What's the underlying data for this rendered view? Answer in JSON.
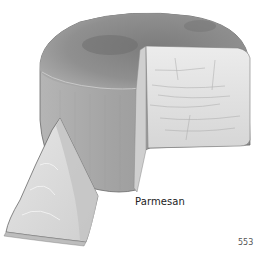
{
  "illustration": {
    "subject": "Parmesan cheese wheel with cut wedge",
    "colors": {
      "rind_dark": "#6f6f6f",
      "rind_mid": "#9a9a9a",
      "rind_light": "#bdbdbd",
      "cut_face": "#e4e4e4",
      "wedge": "#dcdcdc",
      "outline": "#555555"
    }
  },
  "caption": "Parmesan",
  "page_number": "553"
}
